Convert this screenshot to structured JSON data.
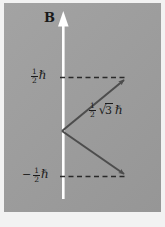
{
  "figure": {
    "background_color": "#9e9e9e",
    "ink_color": "#1a1a1a",
    "field_arrow_color": "#ffffff"
  },
  "field": {
    "label": "B",
    "description": "magnetic field direction arrow pointing up",
    "arrow_color": "#ffffff"
  },
  "levels": [
    {
      "name": "spin-up-level",
      "minus_sign": "",
      "numerator": "1",
      "denominator": "2",
      "unit": "ℏ",
      "value": 0.5,
      "y_px": 77
    },
    {
      "name": "spin-down-level",
      "minus_sign": "−",
      "numerator": "1",
      "denominator": "2",
      "unit": "ℏ",
      "value": -0.5,
      "y_px": 176
    }
  ],
  "magnitude": {
    "name": "vector-magnitude-label",
    "numerator": "1",
    "denominator": "2",
    "radical": "√",
    "radicand": "3",
    "unit": "ℏ",
    "value": 0.866
  },
  "vectors": [
    {
      "name": "spin-up-vector",
      "origin": [
        62,
        131
      ],
      "tip": [
        127,
        78
      ],
      "color": "#4d4d4d"
    },
    {
      "name": "spin-down-vector",
      "origin": [
        62,
        131
      ],
      "tip": [
        127,
        176
      ],
      "color": "#4d4d4d"
    }
  ],
  "dashed_lines": [
    {
      "name": "upper-projection-line",
      "y": 77,
      "x1": 60,
      "x2": 126
    },
    {
      "name": "lower-projection-line",
      "y": 176,
      "x1": 60,
      "x2": 126
    }
  ]
}
